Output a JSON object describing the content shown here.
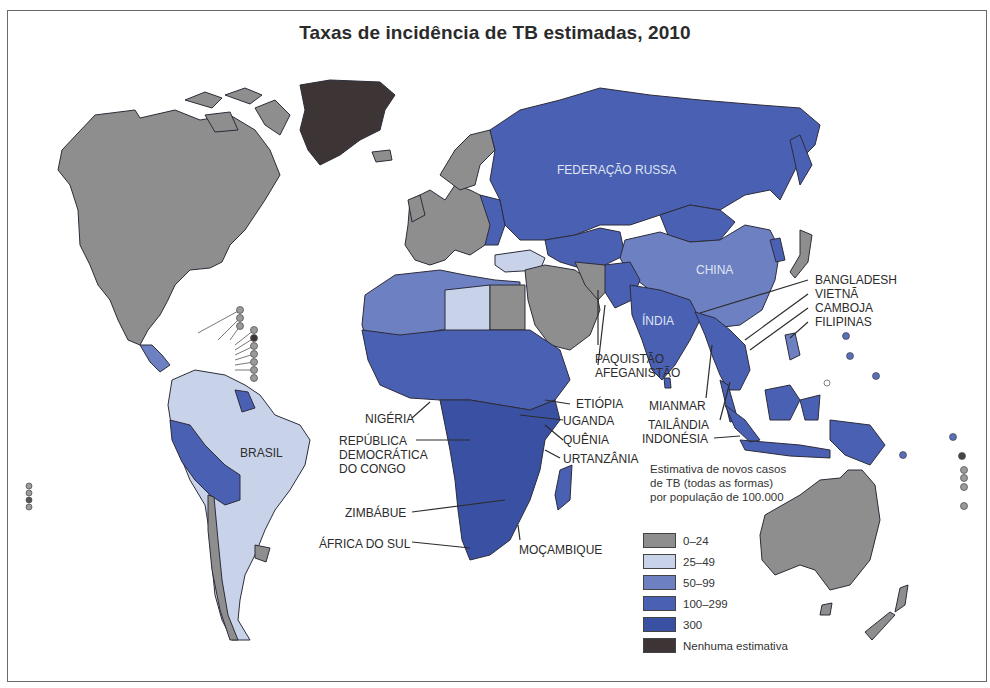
{
  "title": "Taxas de incidência de TB estimadas, 2010",
  "colors": {
    "c0_24": "#8e8e8e",
    "c25_49": "#c8d3ea",
    "c50_99": "#6d80c2",
    "c100_299": "#4a60b3",
    "c300": "#3a51a3",
    "none": "#3d3436",
    "border": "#2c2c3a",
    "ocean": "#ffffff"
  },
  "legend": {
    "note_lines": [
      "Estimativa de novos casos",
      "de TB (todas as formas)",
      "por população de 100.000"
    ],
    "items": [
      {
        "label": "0–24",
        "color": "#8e8e8e"
      },
      {
        "label": "25–49",
        "color": "#c8d3ea"
      },
      {
        "label": "50–99",
        "color": "#6d80c2"
      },
      {
        "label": "100–299",
        "color": "#4a60b3"
      },
      {
        "label": "300",
        "color": "#3a51a3"
      },
      {
        "label": "Nenhuma estimativa",
        "color": "#3d3436"
      }
    ]
  },
  "labels": {
    "russia": "FEDERAÇÃO RUSSA",
    "china": "CHINA",
    "india": "ÍNDIA",
    "brasil": "BRASIL",
    "bangladesh": "BANGLADESH",
    "vietna": "VIETNÃ",
    "camboja": "CAMBOJA",
    "filipinas": "FILIPINAS",
    "paquistao": "PAQUISTÃO",
    "afeganistao": "AFEGANISTÃO",
    "mianmar": "MIANMAR",
    "tailandia": "TAILÂNDIA",
    "indonesia": "INDONÉSIA",
    "etiopia": "ETIÓPIA",
    "uganda": "UGANDA",
    "quenia": "QUÊNIA",
    "tanzania": "URTANZÂNIA",
    "nigeria": "NIGÉRIA",
    "rdc_1": "REPÚBLICA",
    "rdc_2": "DEMOCRÁTICA",
    "rdc_3": "DO CONGO",
    "zimbabue": "ZIMBÁBUE",
    "africa_do_sul": "ÁFRICA DO SUL",
    "mocambique": "MOÇAMBIQUE"
  }
}
